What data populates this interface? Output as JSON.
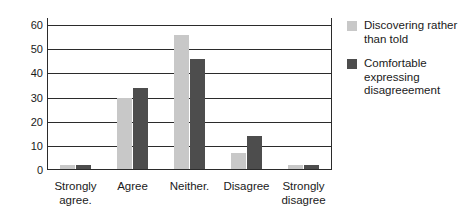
{
  "chart_data": {
    "type": "bar",
    "title": "",
    "xlabel": "",
    "ylabel": "",
    "ylim": [
      0,
      63
    ],
    "yticks": [
      0,
      10,
      20,
      30,
      40,
      50,
      60
    ],
    "ytick_labels": [
      "0",
      "10",
      "20",
      "30",
      "40",
      "50",
      "60"
    ],
    "grid": true,
    "legend_position": "right",
    "categories": [
      "Strongly\nagree.",
      "Agree",
      "Neither.",
      "Disagree",
      "Strongly\ndisagree"
    ],
    "series": [
      {
        "name": "Discovering rather than told",
        "color": "#c8c8c8",
        "values": [
          2,
          30,
          56,
          7,
          2
        ]
      },
      {
        "name": "Comfortable expressing disagreeement",
        "color": "#4d4d4d",
        "values": [
          2,
          34,
          46,
          14,
          2
        ]
      }
    ]
  },
  "legend": {
    "entries": [
      {
        "label": "Discovering rather than told",
        "swatch": "light"
      },
      {
        "label": "Comfortable expressing disagreeement",
        "swatch": "dark"
      }
    ]
  },
  "colors": {
    "series_light": "#c8c8c8",
    "series_dark": "#4d4d4d",
    "axis": "#2b2b2b",
    "text": "#1a1a1a",
    "background": "#ffffff"
  }
}
